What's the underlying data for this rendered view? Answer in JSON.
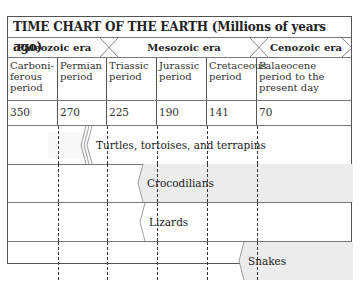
{
  "title": "TIME CHART OF THE EARTH (Millions of years ago)",
  "eras": [
    {
      "label": "Paleozoic era"
    },
    {
      "label": "Mesozoic era"
    },
    {
      "label": "Cenozoic era"
    }
  ],
  "periods": [
    {
      "label": "Carboni- ferous period",
      "start_mya": "350"
    },
    {
      "label": "Permian period",
      "start_mya": "270"
    },
    {
      "label": "Triassic period",
      "start_mya": "225"
    },
    {
      "label": "Jurassic period",
      "start_mya": "190"
    },
    {
      "label": "Cretaceous period",
      "start_mya": "141"
    },
    {
      "label": "Palaeocene period to the present day",
      "start_mya": "70"
    }
  ],
  "lineages": [
    {
      "label": "Turtles, tortoises, and terrapins",
      "begins_in": "Permian period",
      "fill": "#ffffff"
    },
    {
      "label": "Crocodilians",
      "begins_in": "Triassic period",
      "fill": "#ececec"
    },
    {
      "label": "Lizards",
      "begins_in": "Triassic period",
      "fill": "#ffffff"
    },
    {
      "label": "Snakes",
      "begins_in": "Cretaceous period",
      "fill": "#ececec"
    }
  ],
  "colors": {
    "border": "#555555",
    "shaded_bar": "#ececec",
    "text": "#222222"
  }
}
